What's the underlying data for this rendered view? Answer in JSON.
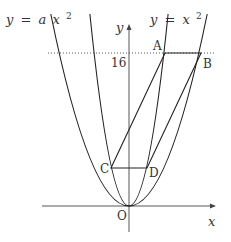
{
  "figure": {
    "type": "coordinate-geometry-diagram",
    "curves": [
      {
        "name": "wide-parabola",
        "equation_label": "y = a x 2",
        "equation_parts": {
          "lhs": "y",
          "eq": "=",
          "coef": "a",
          "var": "x",
          "exp": "2"
        }
      },
      {
        "name": "narrow-parabola",
        "equation_label": "y = x 2",
        "equation_parts": {
          "lhs": "y",
          "eq": "=",
          "var": "x",
          "exp": "2"
        }
      }
    ],
    "axes": {
      "x_label": "x",
      "y_label": "y",
      "origin_label": "O"
    },
    "y_tick": {
      "label": "16",
      "value": 16
    },
    "points": {
      "A": {
        "label": "A"
      },
      "B": {
        "label": "B"
      },
      "C": {
        "label": "C"
      },
      "D": {
        "label": "D"
      }
    },
    "colors": {
      "stroke": "#222222",
      "text": "#333333"
    }
  }
}
